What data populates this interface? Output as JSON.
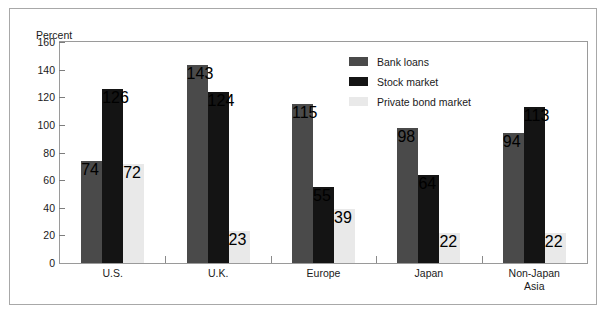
{
  "chart_data": {
    "type": "bar",
    "title": "",
    "subtitle": "",
    "xlabel": "",
    "ylabel": "Percent",
    "ylim": [
      0,
      160
    ],
    "yticks": [
      0,
      20,
      40,
      60,
      80,
      100,
      120,
      140,
      160
    ],
    "grid": false,
    "legend_position": "top-right",
    "categories": [
      "U.S.",
      "U.K.",
      "Europe",
      "Japan",
      "Non-Japan\nAsia"
    ],
    "series": [
      {
        "name": "Bank loans",
        "color": "#4a4a4a",
        "values": [
          74,
          143,
          115,
          98,
          94
        ]
      },
      {
        "name": "Stock market",
        "color": "#141414",
        "values": [
          126,
          124,
          55,
          64,
          113
        ]
      },
      {
        "name": "Private bond market",
        "color": "#e9e9e9",
        "values": [
          72,
          23,
          39,
          22,
          22
        ]
      }
    ]
  },
  "colors": {
    "figure_border": "#a8a8a8",
    "plot_border": "#9a9a9a",
    "tick": "#7d7d7d",
    "text": "#1a1a1a",
    "background": "#ffffff"
  }
}
